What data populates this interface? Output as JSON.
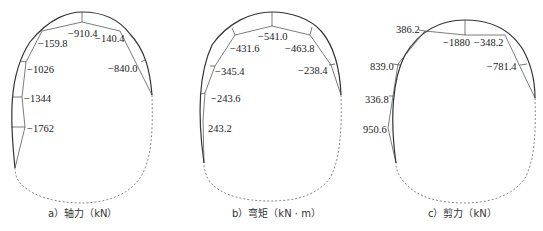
{
  "figure": {
    "panels": [
      {
        "id": "a",
        "caption": "a）轴力（kN）",
        "quantity": "axial force",
        "unit": "kN",
        "labels": [
          "−910.4",
          "−140.4",
          "−159.8",
          "−1026",
          "−840.0",
          "−1344",
          "−1762"
        ]
      },
      {
        "id": "b",
        "caption": "b）弯矩（kN · m）",
        "quantity": "bending moment",
        "unit": "kN·m",
        "labels": [
          "−541.0",
          "−431.6",
          "−463.8",
          "−345.4",
          "−238.4",
          "−243.6",
          "243.2"
        ]
      },
      {
        "id": "c",
        "caption": "c）剪力（kN）",
        "quantity": "shear force",
        "unit": "kN",
        "labels": [
          "386.2",
          "−1880",
          "−348.2",
          "839.0",
          "−781.4",
          "336.8",
          "950.6"
        ]
      }
    ]
  }
}
